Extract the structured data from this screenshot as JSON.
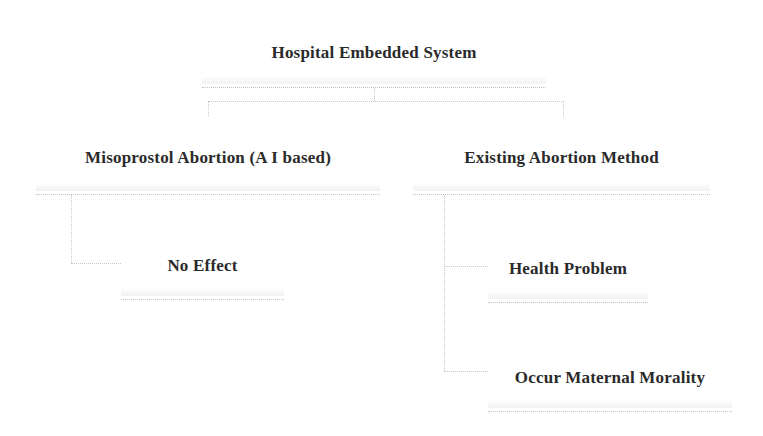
{
  "diagram": {
    "type": "tree",
    "root": {
      "id": "root",
      "label": "Hospital Embedded System"
    },
    "nodes": [
      {
        "id": "misoprostol",
        "label": "Misoprostol Abortion (A I based)",
        "parent": "root"
      },
      {
        "id": "existing",
        "label": "Existing Abortion Method",
        "parent": "root"
      },
      {
        "id": "no_effect",
        "label": "No Effect",
        "parent": "misoprostol"
      },
      {
        "id": "health_problem",
        "label": "Health Problem",
        "parent": "existing"
      },
      {
        "id": "maternal",
        "label": "Occur Maternal Morality",
        "parent": "existing"
      }
    ],
    "colors": {
      "text": "#2a2a2a",
      "border": "#c4c4c4",
      "background": "#ffffff"
    }
  }
}
